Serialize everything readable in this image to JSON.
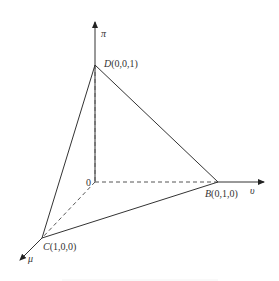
{
  "diagram": {
    "type": "3d-simplex-tetrahedron",
    "axes": {
      "vertical": {
        "label": "π"
      },
      "horizontal": {
        "label": "υ"
      },
      "depth": {
        "label": "μ"
      }
    },
    "origin_label": "0",
    "points": {
      "D": {
        "label_letter": "D",
        "coords": "(0,0,1)"
      },
      "B": {
        "label_letter": "B",
        "coords": "(0,1,0)"
      },
      "C": {
        "label_letter": "C",
        "coords": "(1,0,0)"
      }
    },
    "colors": {
      "line": "#333333",
      "dashed": "#555555",
      "background": "#ffffff"
    }
  }
}
